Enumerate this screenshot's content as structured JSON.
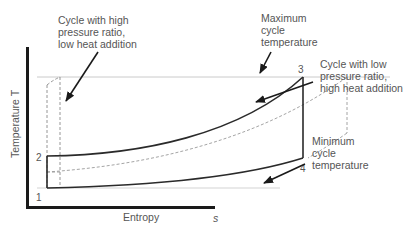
{
  "diagram": {
    "axes": {
      "y_label": "Temperature T",
      "x_label": "Entropy",
      "x_symbol": "s"
    },
    "state_points": [
      "1",
      "2",
      "3",
      "4"
    ],
    "annotations": {
      "high_pressure": [
        "Cycle with high",
        "pressure ratio,",
        "low heat addition"
      ],
      "max_temp": [
        "Maximum",
        "cycle",
        "temperature"
      ],
      "low_pressure": [
        "Cycle with low",
        "pressure ratio,",
        "high heat addition"
      ],
      "min_temp": [
        "Minimum",
        "cycle",
        "temperature"
      ]
    },
    "colors": {
      "axis": "#1a1a1a",
      "main_cycle": "#2a2a2a",
      "dashed_cycle": "#9a9a9a",
      "reference_line": "#bdbdbd",
      "text": "#555555"
    }
  }
}
